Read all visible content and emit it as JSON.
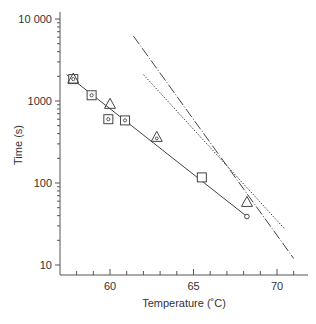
{
  "chart_data": {
    "type": "scatter",
    "title": "",
    "xlabel": "Temperature (˚C)",
    "ylabel": "Time (s)",
    "xlim": [
      57.0,
      72.0
    ],
    "ylim": [
      10,
      10000
    ],
    "yscale": "log",
    "grid": false,
    "legend": null,
    "x_ticks": [
      {
        "value": 60,
        "label": "60"
      },
      {
        "value": 65,
        "label": "65"
      },
      {
        "value": 70,
        "label": "70"
      }
    ],
    "y_ticks": [
      {
        "value": 10,
        "label": "10"
      },
      {
        "value": 100,
        "label": "100"
      },
      {
        "value": 1000,
        "label": "1000"
      },
      {
        "value": 10000,
        "label": "10 000"
      }
    ],
    "series": [
      {
        "name": "dotted-square",
        "marker": "square-dot",
        "points": [
          [
            57.8,
            1850
          ],
          [
            58.9,
            1175
          ],
          [
            59.9,
            600
          ],
          [
            60.9,
            580
          ]
        ]
      },
      {
        "name": "triangle",
        "marker": "triangle",
        "points": [
          [
            57.8,
            1850
          ],
          [
            60.0,
            910
          ],
          [
            62.8,
            360
          ],
          [
            68.2,
            58
          ]
        ]
      },
      {
        "name": "square",
        "marker": "square",
        "points": [
          [
            65.5,
            117
          ]
        ]
      },
      {
        "name": "circle",
        "marker": "circle",
        "points": [
          [
            68.2,
            39
          ]
        ]
      }
    ],
    "lines": [
      {
        "name": "fit-solid",
        "style": "solid",
        "points": [
          [
            57.4,
            2100
          ],
          [
            68.2,
            39
          ]
        ]
      },
      {
        "name": "fit-dashdot",
        "style": "dash-dot",
        "points": [
          [
            61.4,
            6200
          ],
          [
            71.0,
            12
          ]
        ]
      },
      {
        "name": "fit-dotted",
        "style": "dotted",
        "points": [
          [
            62.0,
            2100
          ],
          [
            70.5,
            27
          ]
        ]
      }
    ]
  },
  "axes": {
    "x_title": "Temperature (˚C)",
    "y_title": "Time (s)"
  }
}
